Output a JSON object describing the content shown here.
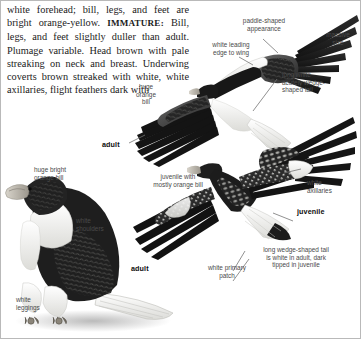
{
  "plate": {
    "species": "Steller's Sea-Eagle",
    "description_paragraph": "white forehead; bill, legs, and feet are bright orange-yellow. IMMATURE: Bill, legs, and feet slightly duller than adult. Plumage variable. Head brown with pale streaking on neck and breast. Underwing coverts brown streaked with white, white axillaries, flight feathers dark with",
    "description_parts": {
      "before_caps": "white forehead; bill, legs, and feet are bright orange-yellow. ",
      "caps_word": "IMMATURE:",
      "after_caps": " Bill, legs, and feet slightly duller than adult. Plumage variable. Head brown with pale streaking on neck and breast. Underwing coverts brown streaked with white, white axillaries, flight feathers dark with"
    }
  },
  "labels": {
    "paddle_shaped": "paddle-shaped\nappearance",
    "white_leading_edge": "white leading\nedge to wing",
    "massive_size": "massive\nsize",
    "long_white_tail": "long white\nacutely wedge-\nshaped tail",
    "huge_orange_bill": "huge\norange\nbill",
    "adult_flight": "adult",
    "juvenile_bill": "juvenile with\nmostly orange bill",
    "white_axillaries": "white\naxillaries",
    "juvenile_flight": "juvenile",
    "long_wedge_tail": "long wedge-shaped tail\nis white in adult, dark\ntipped in juvenile",
    "white_primary_patch": "white primary\npatch",
    "huge_bright_orange_bill": "huge bright\norange bill",
    "white_shoulders": "white\nshoulders",
    "adult_perched": "adult",
    "white_leggings": "white\nleggings"
  },
  "colors": {
    "page_background": "#ffffff",
    "body_text": "#1b1b1b",
    "label_text": "#4a4a4a",
    "label_bold_text": "#0d0d0d",
    "leader_line": "#757575",
    "plumage_dark": "#1d1d1d",
    "plumage_mid": "#4c4c4c",
    "plumage_white": "#f4f4f2",
    "bill_orange": "#b9b4aa",
    "frame_border": "#b9b9b9"
  }
}
